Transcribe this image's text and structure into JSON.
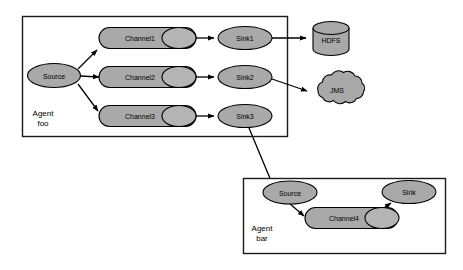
{
  "diagram": {
    "colors": {
      "node_fill": "#a9a9a9",
      "node_stroke": "#000000",
      "container_stroke": "#1a1a1a",
      "background": "#ffffff",
      "edge": "#000000"
    },
    "agents": [
      {
        "id": "agent-foo",
        "label_line1": "Agent",
        "label_line2": "foo",
        "source": {
          "label": "Source"
        },
        "channels": [
          {
            "label": "Channel1"
          },
          {
            "label": "Channel2"
          },
          {
            "label": "Channel3"
          }
        ],
        "sinks": [
          {
            "label": "Sink1"
          },
          {
            "label": "Sink2"
          },
          {
            "label": "Sink3"
          }
        ]
      },
      {
        "id": "agent-bar",
        "label_line1": "Agent",
        "label_line2": "bar",
        "source": {
          "label": "Source"
        },
        "channels": [
          {
            "label": "Channel4"
          }
        ],
        "sinks": [
          {
            "label": "Sink"
          }
        ]
      }
    ],
    "external_systems": [
      {
        "id": "hdfs",
        "label": "HDFS",
        "shape": "cylinder"
      },
      {
        "id": "jms",
        "label": "JMS",
        "shape": "cloud"
      }
    ],
    "edges": [
      {
        "from": "agent-foo.source",
        "to": "agent-foo.channel1"
      },
      {
        "from": "agent-foo.source",
        "to": "agent-foo.channel2"
      },
      {
        "from": "agent-foo.source",
        "to": "agent-foo.channel3"
      },
      {
        "from": "agent-foo.channel1",
        "to": "agent-foo.sink1"
      },
      {
        "from": "agent-foo.channel2",
        "to": "agent-foo.sink2"
      },
      {
        "from": "agent-foo.channel3",
        "to": "agent-foo.sink3"
      },
      {
        "from": "agent-foo.sink1",
        "to": "hdfs"
      },
      {
        "from": "agent-foo.sink2",
        "to": "jms"
      },
      {
        "from": "agent-foo.sink3",
        "to": "agent-bar.source"
      },
      {
        "from": "agent-bar.source",
        "to": "agent-bar.channel4"
      },
      {
        "from": "agent-bar.channel4",
        "to": "agent-bar.sink"
      }
    ]
  }
}
